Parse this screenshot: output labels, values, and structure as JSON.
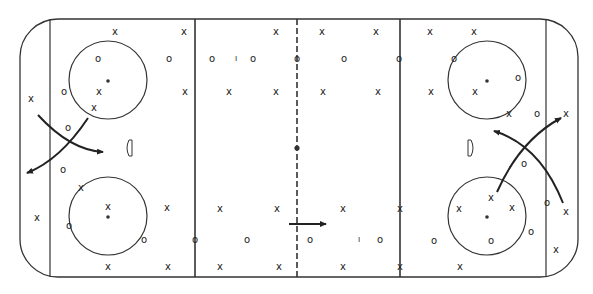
{
  "diagram": {
    "type": "hockey-rink-play-diagram",
    "colors": {
      "line": "#333333",
      "mark": "#222222",
      "background": "#ffffff"
    },
    "rink": {
      "x": 20,
      "y": 19,
      "w": 558,
      "h": 258,
      "corner_radius": 38
    },
    "lines": {
      "goal_left": 50,
      "goal_right": 546,
      "blue_left": 195,
      "blue_right": 400,
      "center": 297
    },
    "center_dot": {
      "x": 297,
      "y": 148
    },
    "faceoff_circles": [
      {
        "name": "top-left",
        "cx": 108,
        "cy": 80,
        "r": 39
      },
      {
        "name": "bottom-left",
        "cx": 108,
        "cy": 216,
        "r": 39
      },
      {
        "name": "top-right",
        "cx": 487,
        "cy": 80,
        "r": 39
      },
      {
        "name": "bottom-right",
        "cx": 487,
        "cy": 216,
        "r": 39
      }
    ],
    "creases": [
      {
        "name": "left",
        "x": 132,
        "y": 148
      },
      {
        "name": "right",
        "x": 468,
        "y": 148
      }
    ],
    "players": [
      {
        "s": "X",
        "x": 115,
        "y": 32
      },
      {
        "s": "X",
        "x": 184,
        "y": 32
      },
      {
        "s": "O",
        "x": 98,
        "y": 59
      },
      {
        "s": "O",
        "x": 169,
        "y": 59
      },
      {
        "s": "O",
        "x": 64,
        "y": 92
      },
      {
        "s": "X",
        "x": 99,
        "y": 92
      },
      {
        "s": "X",
        "x": 185,
        "y": 92
      },
      {
        "s": "X",
        "x": 31,
        "y": 99
      },
      {
        "s": "X",
        "x": 94,
        "y": 108
      },
      {
        "s": "O",
        "x": 68,
        "y": 128
      },
      {
        "s": "O",
        "x": 63,
        "y": 170
      },
      {
        "s": "X",
        "x": 81,
        "y": 188
      },
      {
        "s": "X",
        "x": 108,
        "y": 207
      },
      {
        "s": "X",
        "x": 167,
        "y": 208
      },
      {
        "s": "X",
        "x": 37,
        "y": 218
      },
      {
        "s": "O",
        "x": 69,
        "y": 226
      },
      {
        "s": "O",
        "x": 144,
        "y": 240
      },
      {
        "s": "X",
        "x": 108,
        "y": 267
      },
      {
        "s": "X",
        "x": 168,
        "y": 267
      },
      {
        "s": "X",
        "x": 276,
        "y": 32
      },
      {
        "s": "X",
        "x": 322,
        "y": 32
      },
      {
        "s": "X",
        "x": 376,
        "y": 32
      },
      {
        "s": "O",
        "x": 212,
        "y": 59
      },
      {
        "s": "I",
        "x": 236,
        "y": 59
      },
      {
        "s": "O",
        "x": 253,
        "y": 59
      },
      {
        "s": "O",
        "x": 297,
        "y": 59
      },
      {
        "s": "O",
        "x": 344,
        "y": 59
      },
      {
        "s": "O",
        "x": 399,
        "y": 59
      },
      {
        "s": "X",
        "x": 229,
        "y": 92
      },
      {
        "s": "X",
        "x": 276,
        "y": 92
      },
      {
        "s": "X",
        "x": 323,
        "y": 92
      },
      {
        "s": "X",
        "x": 378,
        "y": 92
      },
      {
        "s": "X",
        "x": 220,
        "y": 209
      },
      {
        "s": "X",
        "x": 277,
        "y": 209
      },
      {
        "s": "X",
        "x": 343,
        "y": 209
      },
      {
        "s": "X",
        "x": 400,
        "y": 209
      },
      {
        "s": "O",
        "x": 195,
        "y": 240
      },
      {
        "s": "O",
        "x": 247,
        "y": 240
      },
      {
        "s": "O",
        "x": 310,
        "y": 240
      },
      {
        "s": "I",
        "x": 359,
        "y": 240
      },
      {
        "s": "O",
        "x": 380,
        "y": 240
      },
      {
        "s": "X",
        "x": 220,
        "y": 267
      },
      {
        "s": "X",
        "x": 279,
        "y": 267
      },
      {
        "s": "X",
        "x": 343,
        "y": 267
      },
      {
        "s": "X",
        "x": 400,
        "y": 267
      },
      {
        "s": "X",
        "x": 430,
        "y": 32
      },
      {
        "s": "X",
        "x": 474,
        "y": 32
      },
      {
        "s": "O",
        "x": 454,
        "y": 59
      },
      {
        "s": "O",
        "x": 518,
        "y": 78
      },
      {
        "s": "X",
        "x": 431,
        "y": 92
      },
      {
        "s": "X",
        "x": 475,
        "y": 92
      },
      {
        "s": "X",
        "x": 509,
        "y": 114
      },
      {
        "s": "O",
        "x": 537,
        "y": 114
      },
      {
        "s": "X",
        "x": 566,
        "y": 114
      },
      {
        "s": "O",
        "x": 524,
        "y": 164
      },
      {
        "s": "X",
        "x": 491,
        "y": 198
      },
      {
        "s": "X",
        "x": 459,
        "y": 209
      },
      {
        "s": "X",
        "x": 512,
        "y": 208
      },
      {
        "s": "O",
        "x": 547,
        "y": 203
      },
      {
        "s": "X",
        "x": 566,
        "y": 212
      },
      {
        "s": "O",
        "x": 531,
        "y": 232
      },
      {
        "s": "O",
        "x": 434,
        "y": 241
      },
      {
        "s": "O",
        "x": 491,
        "y": 241
      },
      {
        "s": "X",
        "x": 556,
        "y": 250
      },
      {
        "s": "X",
        "x": 460,
        "y": 267
      }
    ],
    "arrows": [
      {
        "name": "left-arrow-1",
        "d": "M38 115 Q70 150 103 152",
        "head": "103,152"
      },
      {
        "name": "left-arrow-2",
        "d": "M88 118 Q60 160 27 173",
        "head": "27,173"
      },
      {
        "name": "right-arrow-1",
        "d": "M497 192 Q520 140 561 118",
        "head": "561,118"
      },
      {
        "name": "right-arrow-2",
        "d": "M563 203 Q540 145 494 131",
        "head": "494,131"
      },
      {
        "name": "center-arrow",
        "d": "M289 224 L326 224",
        "head": "326,224"
      }
    ]
  }
}
